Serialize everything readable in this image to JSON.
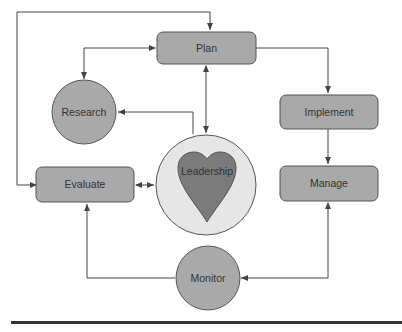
{
  "diagram": {
    "title_fragment": "",
    "nodes": {
      "plan": {
        "label": "Plan",
        "shape": "rounded-rect"
      },
      "research": {
        "label": "Research",
        "shape": "circle"
      },
      "implement": {
        "label": "Implement",
        "shape": "rounded-rect"
      },
      "leadership": {
        "label": "Leadership",
        "shape": "heart-in-circle"
      },
      "evaluate": {
        "label": "Evaluate",
        "shape": "rounded-rect"
      },
      "manage": {
        "label": "Manage",
        "shape": "rounded-rect"
      },
      "monitor": {
        "label": "Monitor",
        "shape": "circle"
      }
    },
    "edges": [
      {
        "from": "evaluate",
        "to": "plan",
        "style": "elbow-over-top"
      },
      {
        "from": "plan",
        "to": "research",
        "bidirectional": true
      },
      {
        "from": "plan",
        "to": "leadership",
        "bidirectional": true
      },
      {
        "from": "plan",
        "to": "implement"
      },
      {
        "from": "leadership",
        "to": "research"
      },
      {
        "from": "implement",
        "to": "manage"
      },
      {
        "from": "evaluate",
        "to": "leadership",
        "bidirectional": true
      },
      {
        "from": "monitor",
        "to": "evaluate"
      },
      {
        "from": "manage",
        "to": "monitor",
        "bidirectional": true
      }
    ],
    "colors": {
      "box_fill": "#a9a9a9",
      "circle_fill": "#a9a9a9",
      "leadership_circle_fill": "#e6e6e6",
      "heart_fill": "#7b7b7b",
      "stroke": "#555555",
      "line": "#444444",
      "rule": "#333333"
    }
  }
}
